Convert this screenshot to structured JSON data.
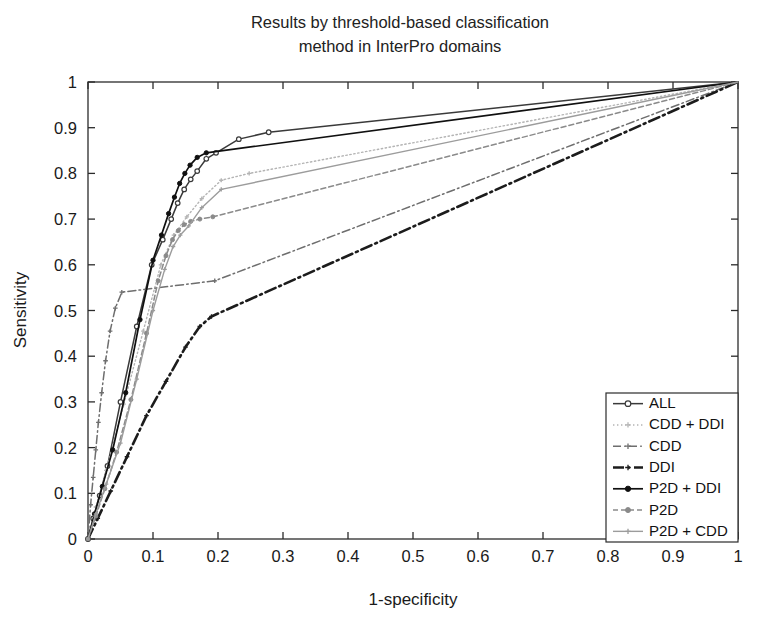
{
  "chart_data": {
    "type": "line",
    "title": "Results by threshold-based classification method in InterPro domains",
    "title_lines": [
      "Results by threshold-based classification",
      "method in InterPro domains"
    ],
    "xlabel": "1-specificity",
    "ylabel": "Sensitivity",
    "xlim": [
      0,
      1
    ],
    "ylim": [
      0,
      1
    ],
    "xticks": [
      "0",
      "0.1",
      "0.2",
      "0.3",
      "0.4",
      "0.5",
      "0.6",
      "0.7",
      "0.8",
      "0.9",
      "1"
    ],
    "yticks": [
      "0",
      "0.1",
      "0.2",
      "0.3",
      "0.4",
      "0.5",
      "0.6",
      "0.7",
      "0.8",
      "0.9",
      "1"
    ],
    "xtick_values": [
      0,
      0.1,
      0.2,
      0.3,
      0.4,
      0.5,
      0.6,
      0.7,
      0.8,
      0.9,
      1
    ],
    "ytick_values": [
      0,
      0.1,
      0.2,
      0.3,
      0.4,
      0.5,
      0.6,
      0.7,
      0.8,
      0.9,
      1
    ],
    "grid": false,
    "legend_position": "lower-right",
    "series": [
      {
        "name": "ALL",
        "color": "#3a3a3a",
        "dash": "none",
        "width": 1.5,
        "marker": "circle-open",
        "marker_size": 4.6,
        "x": [
          0,
          0.008,
          0.018,
          0.03,
          0.05,
          0.075,
          0.098,
          0.115,
          0.128,
          0.138,
          0.148,
          0.158,
          0.168,
          0.182,
          0.197,
          0.232,
          0.278,
          1
        ],
        "y": [
          0,
          0.045,
          0.095,
          0.16,
          0.3,
          0.465,
          0.6,
          0.655,
          0.7,
          0.735,
          0.765,
          0.787,
          0.805,
          0.832,
          0.845,
          0.875,
          0.89,
          1
        ]
      },
      {
        "name": "CDD + DDI",
        "color": "#b4b4b4",
        "dash": "dotted",
        "width": 1.4,
        "marker": "plus",
        "marker_size": 4.2,
        "x": [
          0,
          0.012,
          0.028,
          0.055,
          0.085,
          0.112,
          0.132,
          0.152,
          0.175,
          0.205,
          0.248,
          1
        ],
        "y": [
          0,
          0.07,
          0.15,
          0.295,
          0.455,
          0.6,
          0.665,
          0.705,
          0.745,
          0.785,
          0.8,
          1
        ]
      },
      {
        "name": "CDD",
        "color": "#6e6e6e",
        "dash": "dashdot",
        "width": 1.5,
        "marker": "plus",
        "marker_size": 4.6,
        "x": [
          0,
          0.004,
          0.008,
          0.012,
          0.016,
          0.021,
          0.027,
          0.034,
          0.042,
          0.052,
          0.195,
          1
        ],
        "y": [
          0,
          0.075,
          0.135,
          0.195,
          0.255,
          0.32,
          0.39,
          0.455,
          0.505,
          0.54,
          0.565,
          1
        ]
      },
      {
        "name": "DDI",
        "color": "#1c1c1c",
        "dash": "dashdot-wide",
        "width": 2.6,
        "marker": "plus",
        "marker_size": 4.6,
        "x": [
          0,
          0.015,
          0.035,
          0.06,
          0.09,
          0.12,
          0.15,
          0.172,
          0.19,
          1
        ],
        "y": [
          0,
          0.045,
          0.105,
          0.18,
          0.27,
          0.345,
          0.42,
          0.465,
          0.487,
          1
        ]
      },
      {
        "name": "P2D + DDI",
        "color": "#101010",
        "dash": "none",
        "width": 1.7,
        "marker": "circle-filled",
        "marker_size": 4.3,
        "x": [
          0,
          0.01,
          0.022,
          0.038,
          0.058,
          0.08,
          0.1,
          0.113,
          0.124,
          0.133,
          0.141,
          0.149,
          0.157,
          0.168,
          0.182,
          1
        ],
        "y": [
          0,
          0.055,
          0.115,
          0.195,
          0.32,
          0.48,
          0.61,
          0.665,
          0.712,
          0.748,
          0.778,
          0.8,
          0.818,
          0.835,
          0.845,
          1
        ]
      },
      {
        "name": "P2D",
        "color": "#8a8a8a",
        "dash": "dashed-fine",
        "width": 1.5,
        "marker": "circle-filled",
        "marker_size": 4.0,
        "x": [
          0,
          0.012,
          0.026,
          0.044,
          0.066,
          0.09,
          0.108,
          0.12,
          0.13,
          0.139,
          0.148,
          0.158,
          0.172,
          0.192,
          1
        ],
        "y": [
          0,
          0.05,
          0.11,
          0.19,
          0.305,
          0.45,
          0.565,
          0.62,
          0.655,
          0.675,
          0.688,
          0.695,
          0.7,
          0.705,
          1
        ]
      },
      {
        "name": "P2D + CDD",
        "color": "#9c9c9c",
        "dash": "none",
        "width": 1.4,
        "marker": "plus",
        "marker_size": 4.2,
        "x": [
          0,
          0.012,
          0.028,
          0.05,
          0.075,
          0.1,
          0.118,
          0.131,
          0.142,
          0.155,
          0.175,
          0.205,
          1
        ],
        "y": [
          0,
          0.055,
          0.12,
          0.21,
          0.35,
          0.5,
          0.59,
          0.64,
          0.665,
          0.685,
          0.725,
          0.765,
          1
        ]
      }
    ]
  },
  "legend": {
    "items": [
      {
        "label": "ALL"
      },
      {
        "label": "CDD + DDI"
      },
      {
        "label": "CDD"
      },
      {
        "label": "DDI"
      },
      {
        "label": "P2D + DDI"
      },
      {
        "label": "P2D"
      },
      {
        "label": "P2D + CDD"
      }
    ]
  }
}
